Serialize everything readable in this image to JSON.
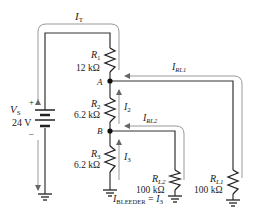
{
  "source": {
    "name": "V",
    "sub": "S",
    "value": "24 V",
    "plus": "+",
    "minus": "–"
  },
  "resistors": [
    {
      "id": "R1",
      "name": "R",
      "sub": "1",
      "value": "12 kΩ"
    },
    {
      "id": "R2",
      "name": "R",
      "sub": "2",
      "value": "6.2 kΩ"
    },
    {
      "id": "R3",
      "name": "R",
      "sub": "3",
      "value": "6.2 kΩ"
    },
    {
      "id": "RL2",
      "name": "R",
      "sub": "L2",
      "value": "100 kΩ"
    },
    {
      "id": "RL1",
      "name": "R",
      "sub": "L1",
      "value": "100 kΩ"
    }
  ],
  "nodes": {
    "a": "A",
    "b": "B"
  },
  "currents": {
    "it": {
      "name": "I",
      "sub": "T"
    },
    "i2": {
      "name": "I",
      "sub": "2"
    },
    "i3": {
      "name": "I",
      "sub": "3"
    },
    "irl1": {
      "name": "I",
      "sub": "RL1"
    },
    "irl2": {
      "name": "I",
      "sub": "RL2"
    }
  },
  "equation": {
    "lhs": "I",
    "lhs_sub": "BLEEDER",
    "eq": " = ",
    "rhs": "I",
    "rhs_sub": "3"
  }
}
